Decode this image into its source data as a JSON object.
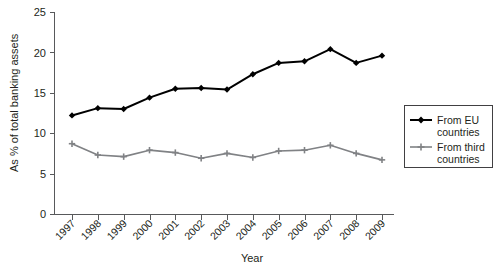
{
  "chart_data": {
    "type": "line",
    "title": "",
    "xlabel": "Year",
    "ylabel": "As % of total banking assets",
    "categories": [
      "1997",
      "1998",
      "1999",
      "2000",
      "2001",
      "2002",
      "2003",
      "2004",
      "2005",
      "2006",
      "2007",
      "2008",
      "2009"
    ],
    "x": [
      1997,
      1998,
      1999,
      2000,
      2001,
      2002,
      2003,
      2004,
      2005,
      2006,
      2007,
      2008,
      2009
    ],
    "series": [
      {
        "name": "From EU countries",
        "color": "#000000",
        "marker": "diamond",
        "values": [
          12.2,
          13.1,
          13.0,
          14.4,
          15.5,
          15.6,
          15.4,
          17.3,
          18.7,
          18.9,
          20.4,
          18.7,
          19.6
        ]
      },
      {
        "name": "From third countries",
        "color": "#808285",
        "marker": "plus",
        "values": [
          8.7,
          7.3,
          7.1,
          7.9,
          7.6,
          6.9,
          7.5,
          7.0,
          7.8,
          7.9,
          8.5,
          7.5,
          6.7
        ]
      }
    ],
    "ylim": [
      0,
      25
    ],
    "yticks": [
      0,
      5,
      10,
      15,
      20,
      25
    ],
    "ytick_labels": [
      "0",
      "5",
      "10",
      "15",
      "20",
      "25"
    ],
    "xlim": [
      1997,
      2009
    ],
    "grid": false,
    "legend_position": "right",
    "legend_entries": [
      "From EU countries",
      "From third countries"
    ]
  },
  "axes": {
    "y_title": "As % of total banking assets",
    "x_title": "Year"
  },
  "legend": {
    "entry_1_line_1": "From EU",
    "entry_1_line_2": "countries",
    "entry_2_line_1": "From third",
    "entry_2_line_2": "countries"
  },
  "colors": {
    "eu_series": "#000000",
    "third_series": "#808285",
    "axis": "#58595b",
    "text": "#231f20",
    "background": "#ffffff"
  }
}
